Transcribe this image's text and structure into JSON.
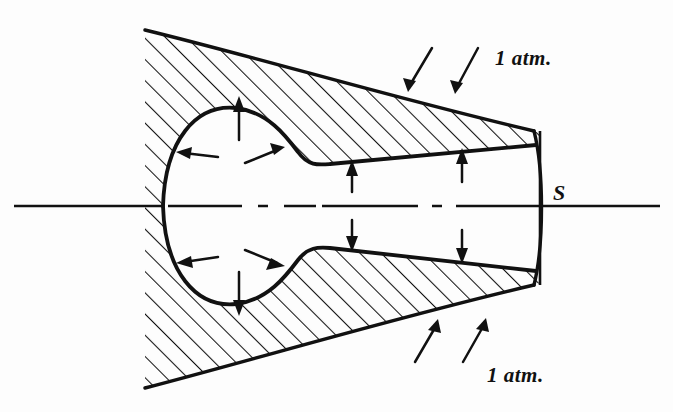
{
  "figure": {
    "kind": "engineering-cross-section-diagram",
    "title": "",
    "background_color": "#fdfdfd",
    "ink_color": "#111111"
  },
  "labels": {
    "pressure_top": "1 atm.",
    "pressure_bottom": "1 atm.",
    "section_plane": "S"
  },
  "annotations": {
    "hatching_angle_deg": 45,
    "hatching_meaning": "sectioned-solid-material",
    "arrow_meaning": "atmospheric-pressure-acting-normal-to-surface",
    "centerline_style": "dash-dot axis of revolution"
  },
  "geometry": {
    "outer_body": {
      "description": "wedge-shaped sectioned solid opening to the left, tapering to the right toward section plane S",
      "top_leading_edge": [
        145,
        30
      ],
      "bottom_leading_edge": [
        145,
        388
      ],
      "right_top": [
        540,
        133
      ],
      "right_bottom": [
        540,
        283
      ]
    },
    "internal_cavity": {
      "description": "bulbous closed chamber on the left joined by a narrow throat running right to the section plane",
      "bulge_center": [
        225,
        206
      ],
      "bulge_rx": 63,
      "bulge_ry": 98,
      "throat_top_y": 160,
      "throat_bottom_y": 252
    },
    "centerline": {
      "y": 206,
      "x_start": 14,
      "x_end": 660
    },
    "section_line_x": 540
  },
  "arrows": [
    {
      "name": "outer-top-right-a",
      "from": [
        432,
        48
      ],
      "to": [
        408,
        88
      ],
      "target": "outer-upper-surface"
    },
    {
      "name": "outer-top-right-b",
      "from": [
        478,
        48
      ],
      "to": [
        455,
        90
      ],
      "target": "outer-upper-surface"
    },
    {
      "name": "outer-bottom-right-a",
      "from": [
        415,
        362
      ],
      "to": [
        435,
        322
      ],
      "target": "outer-lower-surface"
    },
    {
      "name": "outer-bottom-right-b",
      "from": [
        463,
        362
      ],
      "to": [
        483,
        321
      ],
      "target": "outer-lower-surface"
    },
    {
      "name": "cavity-top-up",
      "from": [
        239,
        137
      ],
      "to": [
        239,
        96
      ],
      "target": "cavity-upper-bulge"
    },
    {
      "name": "cavity-bottom-down",
      "from": [
        239,
        275
      ],
      "to": [
        239,
        316
      ],
      "target": "cavity-lower-bulge"
    },
    {
      "name": "cavity-left-upper",
      "from": [
        215,
        155
      ],
      "to": [
        178,
        155
      ],
      "target": "cavity-left-wall"
    },
    {
      "name": "cavity-left-lower",
      "from": [
        215,
        259
      ],
      "to": [
        178,
        259
      ],
      "target": "cavity-left-wall"
    },
    {
      "name": "cavity-right-upper",
      "from": [
        243,
        163
      ],
      "to": [
        283,
        148
      ],
      "target": "cavity-right-shoulder"
    },
    {
      "name": "cavity-right-lower",
      "from": [
        243,
        250
      ],
      "to": [
        283,
        265
      ],
      "target": "cavity-right-shoulder"
    },
    {
      "name": "throat-top-a",
      "from": [
        352,
        190
      ],
      "to": [
        352,
        160
      ],
      "target": "throat-upper-wall"
    },
    {
      "name": "throat-top-b",
      "from": [
        462,
        180
      ],
      "to": [
        462,
        148
      ],
      "target": "throat-upper-wall"
    },
    {
      "name": "throat-bottom-a",
      "from": [
        352,
        222
      ],
      "to": [
        352,
        252
      ],
      "target": "throat-lower-wall"
    },
    {
      "name": "throat-bottom-b",
      "from": [
        462,
        232
      ],
      "to": [
        462,
        264
      ],
      "target": "throat-lower-wall"
    }
  ],
  "label_positions": {
    "pressure_top": [
      495,
      65
    ],
    "pressure_bottom": [
      487,
      382
    ],
    "section_plane": [
      553,
      200
    ]
  }
}
